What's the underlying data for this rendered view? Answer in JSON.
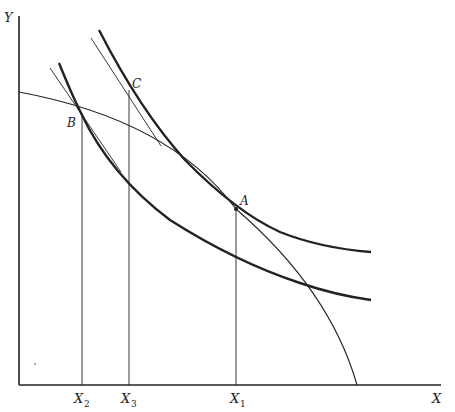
{
  "diagram": {
    "type": "indifference-curve diagram",
    "axes": {
      "y_label": "Y",
      "x_label": "X",
      "x_ticks": [
        {
          "base": "X",
          "sub": "2"
        },
        {
          "base": "X",
          "sub": "3"
        },
        {
          "base": "X",
          "sub": "1"
        }
      ]
    },
    "points": {
      "A": "A",
      "B": "B",
      "C": "C"
    },
    "curves": [
      {
        "name": "higher-indifference-curve",
        "passes_through": [
          "C",
          "A"
        ]
      },
      {
        "name": "lower-indifference-curve",
        "passes_through": [
          "B"
        ]
      },
      {
        "name": "production-possibility-frontier",
        "passes_through": [
          "B",
          "A"
        ]
      },
      {
        "name": "tangent-at-B"
      },
      {
        "name": "tangent-at-C"
      }
    ],
    "colors": {
      "line": "#222222",
      "background": "#ffffff"
    }
  }
}
